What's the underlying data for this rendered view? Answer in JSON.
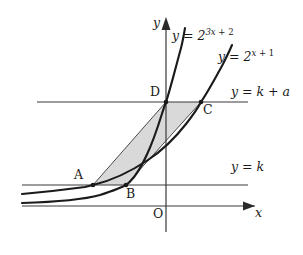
{
  "figure": {
    "background_color": "#ffffff",
    "stroke_color": "#1a1a1a",
    "thin_stroke_color": "#3a3a3a",
    "shade_fill": "#d9d9d9"
  },
  "axes": {
    "x_axis_label": "x",
    "y_axis_label": "y",
    "origin_label": "O"
  },
  "curves": [
    {
      "id": "curve-steep",
      "label_prefix": "y = 2",
      "label_exponent_coef": "3x",
      "label_exponent_sign": " + ",
      "label_exponent_const": "2",
      "label_full": "y = 2^(3x+2)",
      "base": "2",
      "exponent": "3x + 2"
    },
    {
      "id": "curve-shallow",
      "label_prefix": "y = 2",
      "label_exponent_coef": "x",
      "label_exponent_sign": " + ",
      "label_exponent_const": "1",
      "label_full": "y = 2^(x+1)",
      "base": "2",
      "exponent": "x + 1"
    }
  ],
  "horizontal_lines": [
    {
      "id": "line-upper",
      "label_prefix": "y = k",
      "label_suffix": " + a",
      "label_full": "y = k + a",
      "value": "k + a"
    },
    {
      "id": "line-lower",
      "label_prefix": "y = k",
      "label_suffix": "",
      "label_full": "y = k",
      "value": "k"
    }
  ],
  "points": [
    {
      "id": "point-A",
      "label": "A",
      "on_line": "y = k",
      "on_curve": "y = 2^(x+1)"
    },
    {
      "id": "point-B",
      "label": "B",
      "on_line": "y = k",
      "on_curve": "y = 2^(3x+2)"
    },
    {
      "id": "point-C",
      "label": "C",
      "on_line": "y = k + a",
      "on_curve": "y = 2^(x+1)"
    },
    {
      "id": "point-D",
      "label": "D",
      "on_line": "y = k + a",
      "on_curve": "y = 2^(3x+2)"
    }
  ],
  "shaded_region": {
    "id": "region-ABCD",
    "vertices": "A, B, C, D",
    "description": "parallelogram ABCD"
  }
}
